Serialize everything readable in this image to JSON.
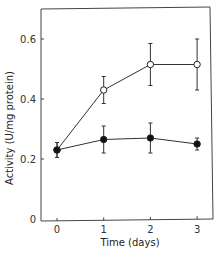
{
  "chart_data": {
    "type": "line",
    "title": "",
    "xlabel": "Time  (days)",
    "ylabel": "Activity  (U/mg protein)",
    "x": [
      0,
      1,
      2,
      3
    ],
    "x_tick_labels": [
      "0",
      "1",
      "2",
      "3"
    ],
    "y_tick_labels": [
      "0",
      "0.2",
      "0.4",
      "0.6"
    ],
    "y_ticks": [
      0,
      0.2,
      0.4,
      0.6
    ],
    "ylim": [
      0,
      0.7
    ],
    "xlim": [
      -0.35,
      3.35
    ],
    "grid": false,
    "legend": null,
    "series": [
      {
        "name": "open circles",
        "marker": "open-circle",
        "values": [
          0.23,
          0.43,
          0.515,
          0.515
        ],
        "errors": [
          0.025,
          0.045,
          0.07,
          0.085
        ]
      },
      {
        "name": "filled circles",
        "marker": "filled-circle",
        "values": [
          0.23,
          0.265,
          0.27,
          0.25
        ],
        "errors": [
          0.025,
          0.045,
          0.05,
          0.02
        ]
      }
    ]
  },
  "colors": {
    "line": "#333333",
    "axis": "#444444"
  }
}
